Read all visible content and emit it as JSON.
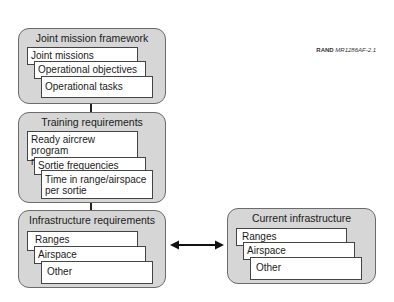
{
  "credit": {
    "org": "RAND",
    "id": "MR1286AF-2.1"
  },
  "groups": [
    {
      "title": "Joint mission framework",
      "items": [
        "Joint missions",
        "Operational objectives",
        "Operational tasks"
      ]
    },
    {
      "title": "Training requirements",
      "items": [
        "Ready aircrew program missions/sorties",
        "Sortie frequencies",
        "Time in range/airspace per sortie"
      ]
    },
    {
      "title": "Infrastructure requirements",
      "items": [
        "Ranges",
        "Airspace",
        "Other"
      ]
    },
    {
      "title": "Current infrastructure",
      "items": [
        "Ranges",
        "Airspace",
        "Other"
      ]
    }
  ],
  "connector": {
    "type": "bidirectional-arrow",
    "between": [
      "Infrastructure requirements",
      "Current infrastructure"
    ]
  }
}
